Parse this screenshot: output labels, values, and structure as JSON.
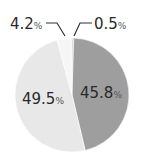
{
  "chart_data": {
    "type": "pie",
    "title": "",
    "slices": [
      {
        "label": "0.5%",
        "value": 0.5,
        "color": "#bdbdbd"
      },
      {
        "label": "45.8%",
        "value": 45.8,
        "color": "#9e9e9e"
      },
      {
        "label": "49.5%",
        "value": 49.5,
        "color": "#e8e8e8"
      },
      {
        "label": "4.2%",
        "value": 4.2,
        "color": "#f6f6f6"
      }
    ],
    "start_angle": "12 o'clock",
    "direction": "clockwise",
    "legend": "none",
    "labels": {
      "s0": {
        "num": "0.5",
        "unit": "%"
      },
      "s1": {
        "num": "45.8",
        "unit": "%"
      },
      "s2": {
        "num": "49.5",
        "unit": "%"
      },
      "s3": {
        "num": "4.2",
        "unit": "%"
      }
    }
  }
}
